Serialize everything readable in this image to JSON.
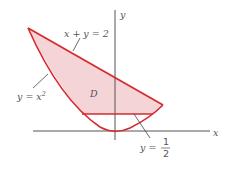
{
  "diagram": {
    "type": "region-between-curves",
    "axes": {
      "x_label": "x",
      "y_label": "y"
    },
    "region": {
      "label": "D",
      "fill_color": "#f4d4d6",
      "stroke_color": "#d42b2f"
    },
    "curves": [
      {
        "id": "line",
        "equation": "x + y = 2"
      },
      {
        "id": "parabola",
        "equation_base": "y = x",
        "exponent": "2"
      },
      {
        "id": "horizontal",
        "equation_prefix": "y = ",
        "numerator": "1",
        "denominator": "2"
      }
    ],
    "colors": {
      "axis": "#555555",
      "leader": "#444444",
      "text": "#555555"
    }
  }
}
